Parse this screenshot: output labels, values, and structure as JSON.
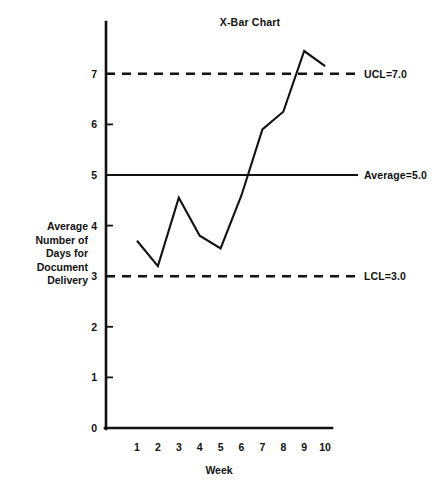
{
  "chart_data": {
    "type": "line",
    "title": "X-Bar Chart",
    "xlabel": "Week",
    "ylabel": "Average Number of Days for Document Delivery",
    "ylabel_lines": [
      "Average",
      "Number of",
      "Days for",
      "Document",
      "Delivery"
    ],
    "categories": [
      "1",
      "2",
      "3",
      "4",
      "5",
      "6",
      "7",
      "8",
      "9",
      "10"
    ],
    "x": [
      1,
      2,
      3,
      4,
      5,
      6,
      7,
      8,
      9,
      10
    ],
    "values": [
      3.7,
      3.2,
      4.55,
      3.8,
      3.55,
      4.6,
      5.9,
      6.25,
      7.45,
      7.15
    ],
    "series": [
      {
        "name": "Average days for document delivery",
        "values": [
          3.7,
          3.2,
          4.55,
          3.8,
          3.55,
          4.6,
          5.9,
          6.25,
          7.45,
          7.15
        ]
      }
    ],
    "ylim": [
      0,
      7.8
    ],
    "xlim": [
      0.3,
      10.6
    ],
    "yticks": [
      0,
      1,
      2,
      3,
      4,
      5,
      6,
      7
    ],
    "ytick_labels": [
      "0",
      "1",
      "2",
      "3",
      "4",
      "5",
      "6",
      "7"
    ],
    "grid": false,
    "legend": "none",
    "line_color": "#111111",
    "background_color": "#ffffff",
    "annotations": [
      {
        "id": "ucl",
        "label": "UCL=7.0",
        "value": 7.0,
        "style": "dashed"
      },
      {
        "id": "average",
        "label": "Average=5.0",
        "value": 5.0,
        "style": "solid"
      },
      {
        "id": "lcl",
        "label": "LCL=3.0",
        "value": 3.0,
        "style": "dashed"
      }
    ]
  }
}
